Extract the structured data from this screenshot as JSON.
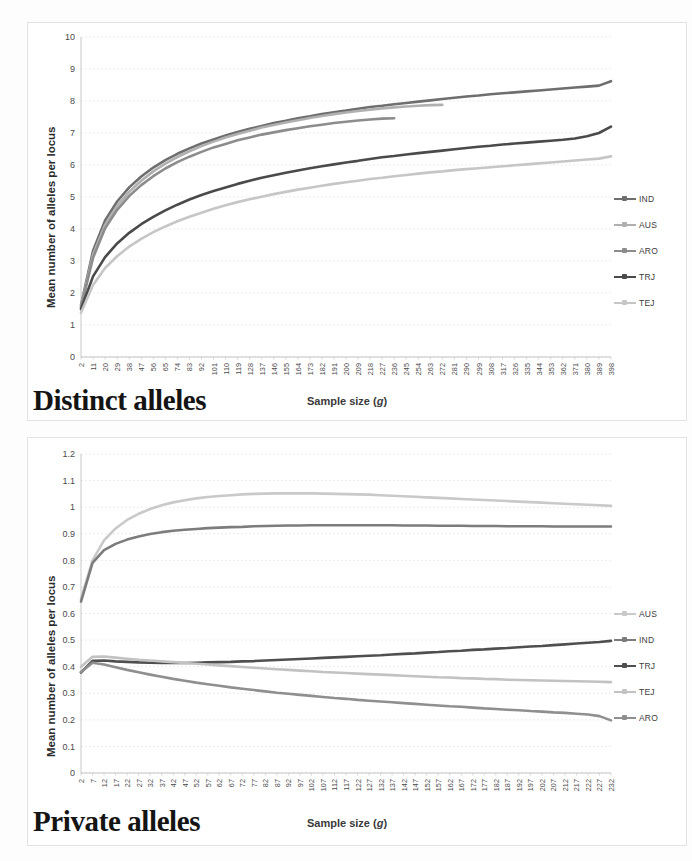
{
  "page": {
    "panels": [
      {
        "id": "distinct",
        "caption": "Distinct alleles"
      },
      {
        "id": "private",
        "caption": "Private alleles"
      }
    ]
  },
  "chart_data": [
    {
      "type": "line",
      "id": "distinct",
      "title": "Distinct alleles",
      "xlabel": "Sample size (g)",
      "ylabel": "Mean number of alleles per locus",
      "xlim": [
        2,
        398
      ],
      "ylim": [
        0,
        10
      ],
      "yticks": [
        0,
        1,
        2,
        3,
        4,
        5,
        6,
        7,
        8,
        9,
        10
      ],
      "ytick_labels": [
        "0",
        "1",
        "2",
        "3",
        "4",
        "5",
        "6",
        "7",
        "8",
        "9",
        "10"
      ],
      "xticks": [
        2,
        11,
        20,
        29,
        38,
        47,
        56,
        65,
        74,
        83,
        92,
        101,
        110,
        119,
        128,
        137,
        146,
        155,
        164,
        173,
        182,
        191,
        200,
        209,
        218,
        227,
        236,
        245,
        254,
        263,
        272,
        281,
        290,
        299,
        308,
        317,
        326,
        335,
        344,
        353,
        362,
        371,
        380,
        389,
        398
      ],
      "grid": true,
      "legend_position": "right",
      "series": [
        {
          "name": "IND",
          "color": "#6e6e6e",
          "x": [
            2,
            11,
            20,
            29,
            38,
            47,
            56,
            65,
            74,
            83,
            92,
            101,
            110,
            119,
            128,
            137,
            146,
            155,
            164,
            173,
            182,
            191,
            200,
            209,
            218,
            227,
            236,
            245,
            254,
            263,
            272,
            281,
            290,
            299,
            308,
            317,
            326,
            335,
            344,
            353,
            362,
            371,
            380,
            389,
            398
          ],
          "y": [
            1.62,
            3.32,
            4.27,
            4.86,
            5.3,
            5.64,
            5.92,
            6.15,
            6.35,
            6.52,
            6.67,
            6.8,
            6.92,
            7.03,
            7.13,
            7.22,
            7.31,
            7.38,
            7.46,
            7.52,
            7.59,
            7.65,
            7.7,
            7.76,
            7.81,
            7.85,
            7.9,
            7.94,
            7.98,
            8.02,
            8.06,
            8.1,
            8.14,
            8.17,
            8.21,
            8.24,
            8.27,
            8.3,
            8.33,
            8.36,
            8.39,
            8.42,
            8.45,
            8.48,
            8.62
          ]
        },
        {
          "name": "AUS",
          "color": "#b0b0b0",
          "x": [
            2,
            11,
            20,
            29,
            38,
            47,
            56,
            65,
            74,
            83,
            92,
            101,
            110,
            119,
            128,
            137,
            146,
            155,
            164,
            173,
            182,
            191,
            200,
            209,
            218,
            227,
            236,
            245,
            254,
            263,
            272
          ],
          "y": [
            1.58,
            3.2,
            4.13,
            4.72,
            5.16,
            5.51,
            5.8,
            6.04,
            6.25,
            6.43,
            6.59,
            6.73,
            6.86,
            6.97,
            7.07,
            7.17,
            7.25,
            7.33,
            7.4,
            7.47,
            7.53,
            7.59,
            7.64,
            7.69,
            7.73,
            7.77,
            7.8,
            7.83,
            7.85,
            7.87,
            7.88
          ]
        },
        {
          "name": "ARO",
          "color": "#8c8c8c",
          "x": [
            2,
            11,
            20,
            29,
            38,
            47,
            56,
            65,
            74,
            83,
            92,
            101,
            110,
            119,
            128,
            137,
            146,
            155,
            164,
            173,
            182,
            191,
            200,
            209,
            218,
            227,
            236
          ],
          "y": [
            1.55,
            3.1,
            4.02,
            4.6,
            5.03,
            5.37,
            5.65,
            5.89,
            6.09,
            6.26,
            6.41,
            6.55,
            6.66,
            6.77,
            6.86,
            6.95,
            7.02,
            7.09,
            7.15,
            7.21,
            7.26,
            7.31,
            7.35,
            7.39,
            7.42,
            7.45,
            7.46
          ]
        },
        {
          "name": "TRJ",
          "color": "#4a4a4a",
          "x": [
            2,
            11,
            20,
            29,
            38,
            47,
            56,
            65,
            74,
            83,
            92,
            101,
            110,
            119,
            128,
            137,
            146,
            155,
            164,
            173,
            182,
            191,
            200,
            209,
            218,
            227,
            236,
            245,
            254,
            263,
            272,
            281,
            290,
            299,
            308,
            317,
            326,
            335,
            344,
            353,
            362,
            371,
            380,
            389,
            398
          ],
          "y": [
            1.5,
            2.52,
            3.12,
            3.55,
            3.88,
            4.15,
            4.38,
            4.58,
            4.76,
            4.92,
            5.06,
            5.19,
            5.3,
            5.41,
            5.51,
            5.6,
            5.68,
            5.76,
            5.83,
            5.9,
            5.96,
            6.02,
            6.08,
            6.13,
            6.19,
            6.24,
            6.28,
            6.33,
            6.37,
            6.41,
            6.45,
            6.49,
            6.53,
            6.57,
            6.6,
            6.64,
            6.67,
            6.7,
            6.73,
            6.76,
            6.79,
            6.83,
            6.9,
            7.0,
            7.2
          ]
        },
        {
          "name": "TEJ",
          "color": "#c6c6c6",
          "x": [
            2,
            11,
            20,
            29,
            38,
            47,
            56,
            65,
            74,
            83,
            92,
            101,
            110,
            119,
            128,
            137,
            146,
            155,
            164,
            173,
            182,
            191,
            200,
            209,
            218,
            227,
            236,
            245,
            254,
            263,
            272,
            281,
            290,
            299,
            308,
            317,
            326,
            335,
            344,
            353,
            362,
            371,
            380,
            389,
            398
          ],
          "y": [
            1.38,
            2.25,
            2.78,
            3.15,
            3.45,
            3.69,
            3.9,
            4.08,
            4.24,
            4.38,
            4.51,
            4.63,
            4.74,
            4.84,
            4.93,
            5.01,
            5.09,
            5.16,
            5.23,
            5.29,
            5.35,
            5.41,
            5.46,
            5.51,
            5.56,
            5.6,
            5.65,
            5.69,
            5.73,
            5.77,
            5.8,
            5.84,
            5.87,
            5.9,
            5.93,
            5.96,
            5.99,
            6.02,
            6.05,
            6.08,
            6.11,
            6.14,
            6.17,
            6.2,
            6.27
          ]
        }
      ]
    },
    {
      "type": "line",
      "id": "private",
      "title": "Private alleles",
      "xlabel": "Sample size (g)",
      "ylabel": "Mean number of alleles per locus",
      "xlim": [
        2,
        232
      ],
      "ylim": [
        0,
        1.2
      ],
      "yticks": [
        0,
        0.1,
        0.2,
        0.3,
        0.4,
        0.5,
        0.6,
        0.7,
        0.8,
        0.9,
        1,
        1.1,
        1.2
      ],
      "ytick_labels": [
        "0",
        "0.1",
        "0.2",
        "0.3",
        "0.4",
        "0.5",
        "0.6",
        "0.7",
        "0.8",
        "0.9",
        "1",
        "1.1",
        "1.2"
      ],
      "xticks": [
        2,
        7,
        12,
        17,
        22,
        27,
        32,
        37,
        42,
        47,
        52,
        57,
        62,
        67,
        72,
        77,
        82,
        87,
        92,
        97,
        102,
        107,
        112,
        117,
        122,
        127,
        132,
        137,
        142,
        147,
        152,
        157,
        162,
        167,
        172,
        177,
        182,
        187,
        192,
        197,
        202,
        207,
        212,
        217,
        222,
        227,
        232
      ],
      "grid": true,
      "legend_position": "right",
      "series": [
        {
          "name": "AUS",
          "color": "#c9c9c9",
          "x": [
            2,
            7,
            12,
            17,
            22,
            27,
            32,
            37,
            42,
            47,
            52,
            57,
            62,
            67,
            72,
            77,
            82,
            87,
            92,
            97,
            102,
            107,
            112,
            117,
            122,
            127,
            132,
            137,
            142,
            147,
            152,
            157,
            162,
            167,
            172,
            177,
            182,
            187,
            192,
            197,
            202,
            207,
            212,
            217,
            222,
            227,
            232
          ],
          "y": [
            0.655,
            0.8,
            0.875,
            0.92,
            0.952,
            0.975,
            0.993,
            1.007,
            1.018,
            1.026,
            1.033,
            1.038,
            1.042,
            1.045,
            1.048,
            1.05,
            1.051,
            1.052,
            1.052,
            1.052,
            1.052,
            1.051,
            1.05,
            1.049,
            1.048,
            1.047,
            1.045,
            1.043,
            1.041,
            1.039,
            1.037,
            1.035,
            1.033,
            1.031,
            1.029,
            1.027,
            1.025,
            1.023,
            1.021,
            1.019,
            1.017,
            1.015,
            1.013,
            1.011,
            1.009,
            1.007,
            1.005
          ]
        },
        {
          "name": "IND",
          "color": "#7c7c7c",
          "x": [
            2,
            7,
            12,
            17,
            22,
            27,
            32,
            37,
            42,
            47,
            52,
            57,
            62,
            67,
            72,
            77,
            82,
            87,
            92,
            97,
            102,
            107,
            112,
            117,
            122,
            127,
            132,
            137,
            142,
            147,
            152,
            157,
            162,
            167,
            172,
            177,
            182,
            187,
            192,
            197,
            202,
            207,
            212,
            217,
            222,
            227,
            232
          ],
          "y": [
            0.645,
            0.79,
            0.838,
            0.862,
            0.878,
            0.89,
            0.899,
            0.906,
            0.911,
            0.915,
            0.918,
            0.921,
            0.923,
            0.925,
            0.926,
            0.928,
            0.929,
            0.93,
            0.931,
            0.931,
            0.932,
            0.932,
            0.932,
            0.932,
            0.932,
            0.932,
            0.932,
            0.932,
            0.931,
            0.931,
            0.931,
            0.93,
            0.93,
            0.93,
            0.929,
            0.929,
            0.929,
            0.928,
            0.928,
            0.928,
            0.928,
            0.927,
            0.927,
            0.927,
            0.927,
            0.927,
            0.927
          ]
        },
        {
          "name": "TRJ",
          "color": "#4f4f4f",
          "x": [
            2,
            7,
            12,
            17,
            22,
            27,
            32,
            37,
            42,
            47,
            52,
            57,
            62,
            67,
            72,
            77,
            82,
            87,
            92,
            97,
            102,
            107,
            112,
            117,
            122,
            127,
            132,
            137,
            142,
            147,
            152,
            157,
            162,
            167,
            172,
            177,
            182,
            187,
            192,
            197,
            202,
            207,
            212,
            217,
            222,
            227,
            232
          ],
          "y": [
            0.378,
            0.422,
            0.423,
            0.42,
            0.418,
            0.416,
            0.415,
            0.414,
            0.414,
            0.414,
            0.415,
            0.416,
            0.417,
            0.418,
            0.42,
            0.421,
            0.423,
            0.425,
            0.427,
            0.429,
            0.431,
            0.433,
            0.435,
            0.437,
            0.439,
            0.441,
            0.443,
            0.446,
            0.448,
            0.45,
            0.453,
            0.455,
            0.458,
            0.46,
            0.463,
            0.465,
            0.468,
            0.47,
            0.473,
            0.476,
            0.478,
            0.481,
            0.484,
            0.487,
            0.49,
            0.493,
            0.497
          ]
        },
        {
          "name": "TEJ",
          "color": "#c2c2c2",
          "x": [
            2,
            7,
            12,
            17,
            22,
            27,
            32,
            37,
            42,
            47,
            52,
            57,
            62,
            67,
            72,
            77,
            82,
            87,
            92,
            97,
            102,
            107,
            112,
            117,
            122,
            127,
            132,
            137,
            142,
            147,
            152,
            157,
            162,
            167,
            172,
            177,
            182,
            187,
            192,
            197,
            202,
            207,
            212,
            217,
            222,
            227,
            232
          ],
          "y": [
            0.4,
            0.437,
            0.438,
            0.434,
            0.43,
            0.426,
            0.423,
            0.42,
            0.417,
            0.414,
            0.411,
            0.408,
            0.405,
            0.402,
            0.399,
            0.396,
            0.393,
            0.39,
            0.388,
            0.385,
            0.383,
            0.38,
            0.378,
            0.376,
            0.374,
            0.372,
            0.37,
            0.368,
            0.366,
            0.364,
            0.362,
            0.36,
            0.359,
            0.357,
            0.356,
            0.354,
            0.353,
            0.351,
            0.35,
            0.349,
            0.348,
            0.347,
            0.346,
            0.345,
            0.344,
            0.343,
            0.342
          ]
        },
        {
          "name": "ARO",
          "color": "#8f8f8f",
          "x": [
            2,
            7,
            12,
            17,
            22,
            27,
            32,
            37,
            42,
            47,
            52,
            57,
            62,
            67,
            72,
            77,
            82,
            87,
            92,
            97,
            102,
            107,
            112,
            117,
            122,
            127,
            132,
            137,
            142,
            147,
            152,
            157,
            162,
            167,
            172,
            177,
            182,
            187,
            192,
            197,
            202,
            207,
            212,
            217,
            222,
            227,
            232
          ],
          "y": [
            0.38,
            0.415,
            0.408,
            0.398,
            0.388,
            0.379,
            0.37,
            0.362,
            0.354,
            0.347,
            0.34,
            0.334,
            0.328,
            0.322,
            0.317,
            0.312,
            0.307,
            0.302,
            0.298,
            0.294,
            0.29,
            0.286,
            0.282,
            0.279,
            0.275,
            0.272,
            0.269,
            0.266,
            0.263,
            0.26,
            0.257,
            0.254,
            0.251,
            0.249,
            0.246,
            0.243,
            0.241,
            0.238,
            0.236,
            0.233,
            0.231,
            0.228,
            0.226,
            0.223,
            0.22,
            0.214,
            0.198
          ]
        }
      ]
    }
  ]
}
